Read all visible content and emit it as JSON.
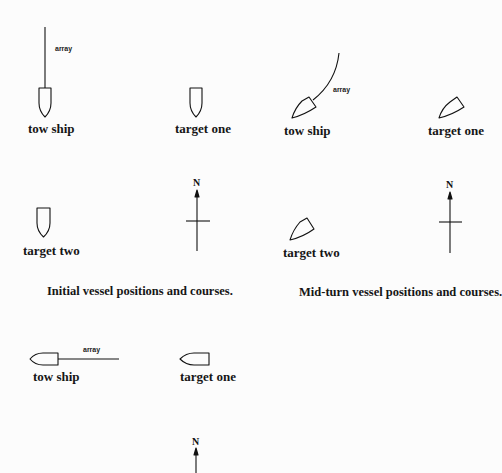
{
  "figure": {
    "panels": [
      {
        "id": "initial",
        "caption": "Initial vessel positions and courses.",
        "vessels": [
          {
            "name": "tow ship",
            "heading": "south",
            "has_array": true,
            "array_label": "array"
          },
          {
            "name": "target one",
            "heading": "south"
          },
          {
            "name": "target two",
            "heading": "south"
          }
        ],
        "compass_label": "N"
      },
      {
        "id": "mid-turn",
        "caption": "Mid-turn vessel positions and courses.",
        "vessels": [
          {
            "name": "tow ship",
            "heading": "southwest",
            "has_array": true,
            "array_label": "array"
          },
          {
            "name": "target one",
            "heading": "southwest"
          },
          {
            "name": "target two",
            "heading": "southwest"
          }
        ],
        "compass_label": "N"
      },
      {
        "id": "final",
        "vessels": [
          {
            "name": "tow ship",
            "heading": "west",
            "has_array": true,
            "array_label": "array"
          },
          {
            "name": "target one",
            "heading": "west"
          }
        ],
        "compass_label": "N"
      }
    ]
  },
  "colors": {
    "ink": "#111111",
    "background": "#fcfcfc"
  }
}
